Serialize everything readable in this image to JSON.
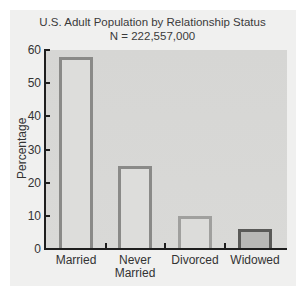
{
  "chart_data": {
    "type": "bar",
    "title": "U.S. Adult Population by Relationship Status",
    "subtitle": "N = 222,557,000",
    "categories": [
      "Married",
      "Never Married",
      "Divorced",
      "Widowed"
    ],
    "values": [
      58,
      25,
      10,
      6
    ],
    "xlabel": "",
    "ylabel": "Percentage",
    "ylim": [
      0,
      60
    ],
    "yticks": [
      0,
      10,
      20,
      30,
      40,
      50,
      60
    ],
    "grid": false,
    "legend": null
  },
  "labels": {
    "title": "U.S. Adult Population by Relationship Status",
    "subtitle": "N = 222,557,000",
    "ylabel": "Percentage",
    "yticks": [
      "0",
      "10",
      "20",
      "30",
      "40",
      "50",
      "60"
    ],
    "categories": [
      "Married",
      "Never",
      "Married",
      "Divorced",
      "Widowed"
    ]
  },
  "colors": {
    "plot_background": "#d7d7d5",
    "card_background": "#f0f0ef",
    "bar_fill_light": "#dddddb",
    "bar_border_medium": "#8a8a88",
    "bar_fill_dark": "#b8b8b6",
    "bar_border_dark": "#5a5a58",
    "axis": "#1e1e1e"
  }
}
